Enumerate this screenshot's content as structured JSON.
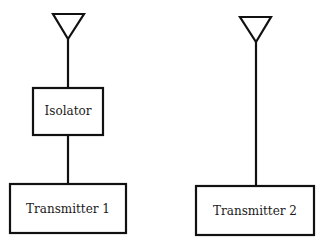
{
  "diagram": {
    "stroke_color": "#111111",
    "background": "#ffffff",
    "left_chain": {
      "antenna": {
        "name": "antenna-1"
      },
      "isolator": {
        "label": "Isolator"
      },
      "transmitter": {
        "label": "Transmitter 1"
      }
    },
    "right_chain": {
      "antenna": {
        "name": "antenna-2"
      },
      "transmitter": {
        "label": "Transmitter 2"
      }
    }
  }
}
